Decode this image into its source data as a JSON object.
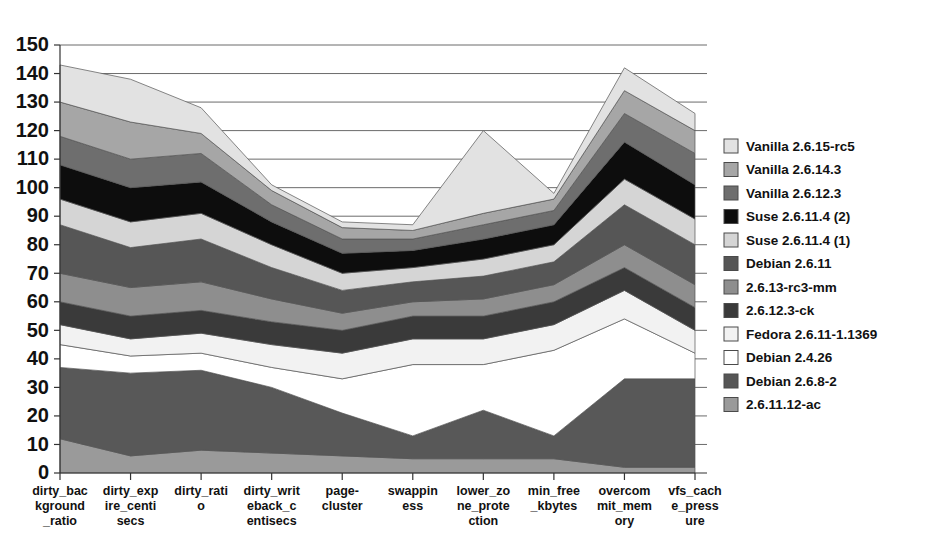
{
  "chart_data": {
    "type": "area",
    "stacked": true,
    "title": "",
    "subtitle": "",
    "xlabel": "",
    "ylabel": "",
    "ylim": [
      0,
      150
    ],
    "ytick_step": 10,
    "grid": true,
    "legend_position": "right",
    "categories": [
      "dirty_background_ratio",
      "dirty_expire_centisecs",
      "dirty_ratio",
      "dirty_writeback_centisecs",
      "page-cluster",
      "swappiness",
      "lower_zone_protection",
      "min_free_kbytes",
      "overcommit_memory",
      "vfs_cache_pressure"
    ],
    "category_label_lines": [
      [
        "dirty_bac",
        "kground",
        "_ratio"
      ],
      [
        "dirty_exp",
        "ire_centi",
        "secs"
      ],
      [
        "dirty_rati",
        "o"
      ],
      [
        "dirty_writ",
        "eback_c",
        "entisecs"
      ],
      [
        "page-",
        "cluster"
      ],
      [
        "swappin",
        "ess"
      ],
      [
        "lower_zo",
        "ne_prote",
        "ction"
      ],
      [
        "min_free",
        "_kbytes"
      ],
      [
        "overcom",
        "mit_mem",
        "ory"
      ],
      [
        "vfs_cach",
        "e_press",
        "ure"
      ]
    ],
    "ytick_labels": [
      "0",
      "10",
      "20",
      "30",
      "40",
      "50",
      "60",
      "70",
      "80",
      "90",
      "100",
      "110",
      "120",
      "130",
      "140",
      "150"
    ],
    "ytick_values": [
      0,
      10,
      20,
      30,
      40,
      50,
      60,
      70,
      80,
      90,
      100,
      110,
      120,
      130,
      140,
      150
    ],
    "stack_order_bottom_to_top": [
      "2.6.11.12-ac",
      "Debian 2.6.8-2",
      "Debian 2.4.26",
      "Fedora 2.6.11-1.1369",
      "2.6.12.3-ck",
      "2.6.13-rc3-mm",
      "Debian 2.6.11",
      "Suse 2.6.11.4 (1)",
      "Suse 2.6.11.4 (2)",
      "Vanilla 2.6.12.3",
      "Vanilla 2.6.14.3",
      "Vanilla 2.6.15-rc5"
    ],
    "series": [
      {
        "name": "2.6.11.12-ac",
        "color": "#9a9a9a",
        "values": [
          12,
          6,
          8,
          7,
          6,
          5,
          5,
          5,
          2,
          2
        ]
      },
      {
        "name": "Debian 2.6.8-2",
        "color": "#585858",
        "values": [
          25,
          29,
          28,
          23,
          15,
          8,
          17,
          8,
          31,
          31
        ]
      },
      {
        "name": "Debian 2.4.26",
        "color": "#ffffff",
        "values": [
          8,
          6,
          6,
          7,
          12,
          25,
          16,
          30,
          21,
          9
        ]
      },
      {
        "name": "Fedora 2.6.11-1.1369",
        "color": "#f2f2f2",
        "values": [
          7,
          6,
          7,
          8,
          9,
          9,
          9,
          9,
          10,
          8
        ]
      },
      {
        "name": "2.6.12.3-ck",
        "color": "#3a3a3a",
        "values": [
          8,
          8,
          8,
          8,
          8,
          8,
          8,
          8,
          8,
          8
        ]
      },
      {
        "name": "2.6.13-rc3-mm",
        "color": "#8e8e8e",
        "values": [
          10,
          10,
          10,
          8,
          6,
          5,
          6,
          6,
          8,
          8
        ]
      },
      {
        "name": "Debian 2.6.11",
        "color": "#565656",
        "values": [
          17,
          14,
          15,
          11,
          8,
          7,
          8,
          8,
          14,
          14
        ]
      },
      {
        "name": "Suse 2.6.11.4 (1)",
        "color": "#d5d5d5",
        "values": [
          9,
          9,
          9,
          8,
          6,
          5,
          6,
          6,
          9,
          9
        ]
      },
      {
        "name": "Suse 2.6.11.4 (2)",
        "color": "#0d0d0d",
        "values": [
          12,
          12,
          11,
          8,
          7,
          6,
          7,
          7,
          13,
          12
        ]
      },
      {
        "name": "Vanilla 2.6.12.3",
        "color": "#6e6e6e",
        "values": [
          10,
          10,
          10,
          6,
          5,
          4,
          5,
          5,
          10,
          11
        ]
      },
      {
        "name": "Vanilla 2.6.14.3",
        "color": "#a6a6a6",
        "values": [
          12,
          13,
          7,
          5,
          4,
          3,
          4,
          4,
          8,
          8
        ]
      },
      {
        "name": "Vanilla 2.6.15-rc5",
        "color": "#e2e2e2",
        "values": [
          13,
          15,
          9,
          2,
          2,
          2,
          29,
          2,
          8,
          6
        ]
      }
    ],
    "totals": [
      143,
      138,
      128,
      101,
      88,
      87,
      120,
      98,
      142,
      126
    ]
  },
  "legend": {
    "entries": [
      {
        "label": "Vanilla 2.6.15-rc5",
        "color": "#e2e2e2"
      },
      {
        "label": "Vanilla 2.6.14.3",
        "color": "#a6a6a6"
      },
      {
        "label": "Vanilla 2.6.12.3",
        "color": "#6e6e6e"
      },
      {
        "label": "Suse 2.6.11.4 (2)",
        "color": "#0d0d0d"
      },
      {
        "label": "Suse 2.6.11.4 (1)",
        "color": "#d5d5d5"
      },
      {
        "label": "Debian 2.6.11",
        "color": "#565656"
      },
      {
        "label": "2.6.13-rc3-mm",
        "color": "#8e8e8e"
      },
      {
        "label": "2.6.12.3-ck",
        "color": "#3a3a3a"
      },
      {
        "label": "Fedora 2.6.11-1.1369",
        "color": "#f2f2f2"
      },
      {
        "label": "Debian 2.4.26",
        "color": "#ffffff"
      },
      {
        "label": "Debian 2.6.8-2",
        "color": "#565656"
      },
      {
        "label": "2.6.11.12-ac",
        "color": "#9a9a9a"
      }
    ]
  },
  "geometry": {
    "plot_left": 60,
    "plot_right": 695,
    "plot_top": 45,
    "plot_bottom": 473,
    "legend_x": 724,
    "legend_y": 146,
    "legend_row_height": 23.5,
    "swatch_size": 14
  }
}
